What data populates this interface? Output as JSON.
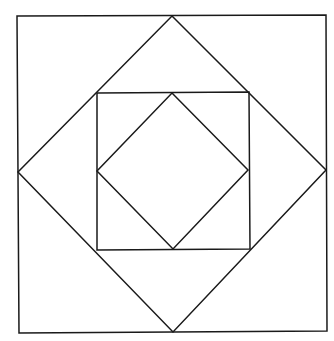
{
  "diagram": {
    "type": "nested-squares-and-diamonds",
    "width": 334,
    "height": 341,
    "background": "#ffffff",
    "stroke_color": "#1a1a1a",
    "stroke_width": 1.5,
    "shapes": [
      {
        "name": "outer-square",
        "kind": "square",
        "points": "17,16 326,15 327,331 19,333"
      },
      {
        "name": "outer-diamond",
        "kind": "diamond",
        "points": "172,16 326,170 173,332 18,172"
      },
      {
        "name": "inner-square",
        "kind": "square",
        "points": "97,93 249,92 250,249 97,250"
      },
      {
        "name": "inner-diamond",
        "kind": "diamond",
        "points": "172,93 248,170 173,249 97,171"
      }
    ]
  }
}
